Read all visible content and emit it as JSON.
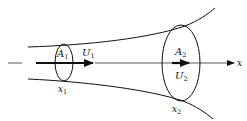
{
  "diagram": {
    "type": "diverging streamtube / duct cross-sections",
    "axis": {
      "label": "x"
    },
    "section1": {
      "area_label": "A",
      "area_sub": "1",
      "velocity_label": "U",
      "velocity_sub": "1",
      "position_label": "x",
      "position_sub": "1"
    },
    "section2": {
      "area_label": "A",
      "area_sub": "2",
      "velocity_label": "U",
      "velocity_sub": "2",
      "position_label": "x",
      "position_sub": "2"
    },
    "colors": {
      "stroke": "#111111",
      "background": "#ffffff"
    }
  }
}
